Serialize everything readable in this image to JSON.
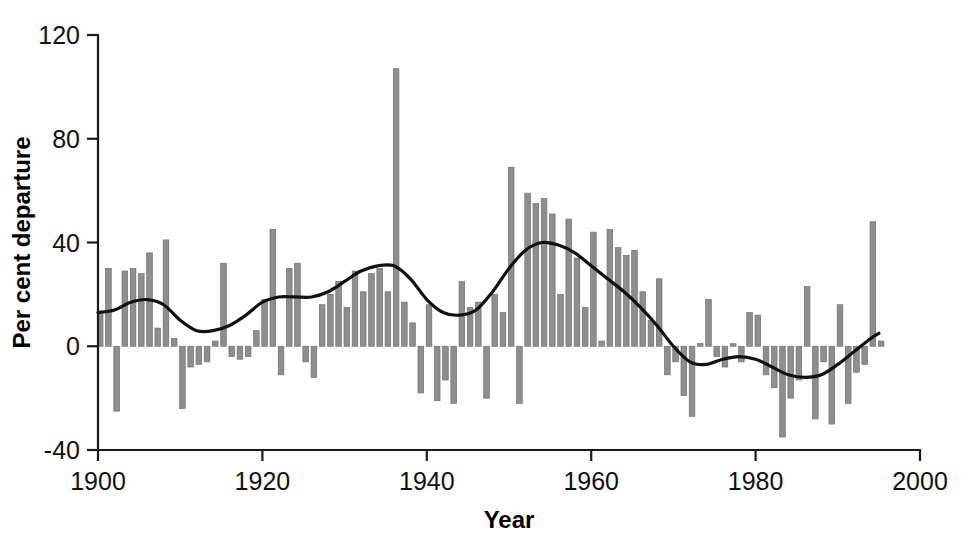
{
  "chart_data": {
    "type": "bar",
    "title": "",
    "subtitle": "",
    "xlabel": "Year",
    "ylabel": "Per cent departure",
    "xlim": [
      1900,
      2000
    ],
    "ylim": [
      -40,
      120
    ],
    "xticks": [
      1900,
      1920,
      1940,
      1960,
      1980,
      2000
    ],
    "xtick_labels": [
      "1900",
      "1920",
      "1940",
      "1960",
      "1980",
      "2000"
    ],
    "yticks": [
      -40,
      0,
      40,
      80,
      120
    ],
    "ytick_labels": [
      "-40",
      "0",
      "40",
      "80",
      "120"
    ],
    "grid": false,
    "legend": null,
    "bar_color": "#8e8e8e",
    "trend_color": "#111111",
    "axis_color": "#1a1a1a",
    "background_color": "#fefefe",
    "categories": [
      1900,
      1901,
      1902,
      1903,
      1904,
      1905,
      1906,
      1907,
      1908,
      1909,
      1910,
      1911,
      1912,
      1913,
      1914,
      1915,
      1916,
      1917,
      1918,
      1919,
      1920,
      1921,
      1922,
      1923,
      1924,
      1925,
      1926,
      1927,
      1928,
      1929,
      1930,
      1931,
      1932,
      1933,
      1934,
      1935,
      1936,
      1937,
      1938,
      1939,
      1940,
      1941,
      1942,
      1943,
      1944,
      1945,
      1946,
      1947,
      1948,
      1949,
      1950,
      1951,
      1952,
      1953,
      1954,
      1955,
      1956,
      1957,
      1958,
      1959,
      1960,
      1961,
      1962,
      1963,
      1964,
      1965,
      1966,
      1967,
      1968,
      1969,
      1970,
      1971,
      1972,
      1973,
      1974,
      1975,
      1976,
      1977,
      1978,
      1979,
      1980,
      1981,
      1982,
      1983,
      1984,
      1985,
      1986,
      1987,
      1988,
      1989,
      1990,
      1991,
      1992,
      1993,
      1994,
      1995
    ],
    "series": [
      {
        "name": "Per cent departure",
        "type": "bar",
        "values": [
          13,
          30,
          -25,
          29,
          30,
          28,
          36,
          7,
          41,
          3,
          -24,
          -8,
          -7,
          -6,
          2,
          32,
          -4,
          -5,
          -4,
          6,
          18,
          45,
          -11,
          30,
          32,
          -6,
          -12,
          16,
          20,
          25,
          15,
          29,
          21,
          28,
          30,
          21,
          107,
          17,
          9,
          -18,
          16,
          -21,
          -13,
          -22,
          25,
          15,
          17,
          -20,
          20,
          13,
          69,
          -22,
          59,
          55,
          57,
          51,
          20,
          49,
          34,
          15,
          44,
          2,
          45,
          38,
          35,
          37,
          21,
          10,
          26,
          -11,
          -6,
          -19,
          -27,
          1,
          18,
          -4,
          -8,
          1,
          -6,
          13,
          12,
          -11,
          -16,
          -35,
          -20,
          -13,
          23,
          -28,
          -6,
          -30,
          16,
          -22,
          -10,
          -7,
          48,
          2
        ]
      },
      {
        "name": "Smoothed trend",
        "type": "line",
        "x": [
          1900,
          1902,
          1904,
          1906,
          1908,
          1910,
          1912,
          1914,
          1916,
          1918,
          1920,
          1922,
          1924,
          1926,
          1928,
          1930,
          1932,
          1934,
          1936,
          1938,
          1940,
          1942,
          1944,
          1946,
          1948,
          1950,
          1952,
          1954,
          1956,
          1958,
          1960,
          1962,
          1964,
          1966,
          1968,
          1970,
          1972,
          1974,
          1976,
          1978,
          1980,
          1982,
          1984,
          1986,
          1988,
          1990,
          1992,
          1994,
          1995
        ],
        "values": [
          13,
          14,
          17,
          18,
          16,
          10,
          6,
          6,
          8,
          12,
          17,
          19,
          19,
          19,
          21,
          25,
          29,
          31,
          31,
          26,
          18,
          13,
          12,
          14,
          21,
          30,
          37,
          40,
          39,
          36,
          31,
          26,
          21,
          15,
          8,
          0,
          -6,
          -7,
          -5,
          -4,
          -5,
          -8,
          -11,
          -12,
          -11,
          -7,
          -2,
          3,
          5
        ]
      }
    ]
  }
}
